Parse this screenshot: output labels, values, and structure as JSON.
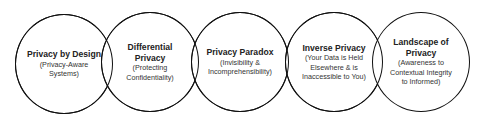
{
  "diagram": {
    "type": "overlapping-circles-sequence",
    "circles": [
      {
        "title": "Privacy by Design",
        "subtitle": "(Privacy-Aware Systems)",
        "sub_lines": [
          "(Privacy-Aware",
          "Systems)"
        ],
        "title_lines": [
          "Privacy by Design"
        ]
      },
      {
        "title": "Differential Privacy",
        "subtitle": "(Protecting Confidentiality)",
        "title_lines": [
          "Differential",
          "Privacy"
        ],
        "sub_lines": [
          "(Protecting",
          "Confidentiality)"
        ]
      },
      {
        "title": "Privacy Paradox",
        "subtitle": "(Invisibility & Incomprehensibility)",
        "title_lines": [
          "Privacy Paradox"
        ],
        "sub_lines": [
          "(Invisibility &",
          "Incomprehensibility)"
        ]
      },
      {
        "title": "Inverse Privacy",
        "subtitle": "(Your Data is Held Elsewhere & is Inaccessible to You)",
        "title_lines": [
          "Inverse Privacy"
        ],
        "sub_lines": [
          "(Your Data is Held",
          "Elsewhere & is",
          "Inaccessible to You)"
        ]
      },
      {
        "title": "Landscape of Privacy",
        "subtitle": "(Awareness to Contextual Integrity to Informed)",
        "title_lines": [
          "Landscape of",
          "Privacy"
        ],
        "sub_lines": [
          "(Awareness to",
          "Contextual Integrity",
          "to Informed)"
        ]
      }
    ]
  },
  "colors": {
    "stroke": "#111111",
    "background": "#ffffff",
    "text": "#222222"
  }
}
